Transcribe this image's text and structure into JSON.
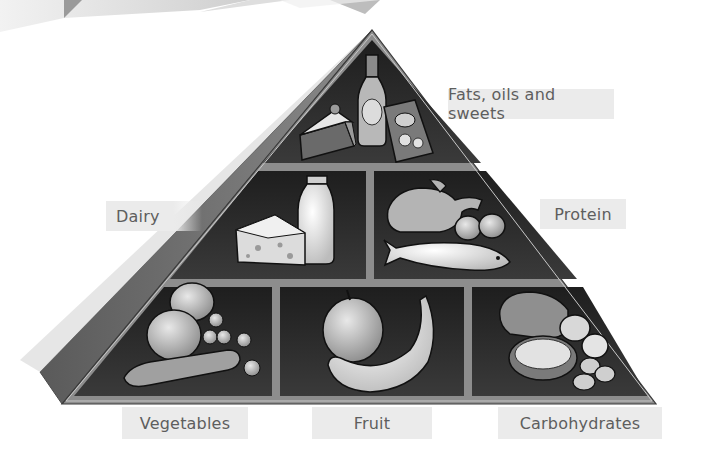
{
  "diagram": {
    "type": "food-pyramid",
    "tiers": [
      {
        "level": "top",
        "groups": [
          {
            "id": "fats",
            "label": "Fats, oils and sweets",
            "items": [
              "cake slice",
              "bottle",
              "crisps bag"
            ]
          }
        ]
      },
      {
        "level": "middle",
        "groups": [
          {
            "id": "dairy",
            "label": "Dairy",
            "items": [
              "cheese wedge",
              "milk bottle"
            ]
          },
          {
            "id": "protein",
            "label": "Protein",
            "items": [
              "chicken",
              "fish",
              "eggs"
            ]
          }
        ]
      },
      {
        "level": "bottom",
        "groups": [
          {
            "id": "vegetables",
            "label": "Vegetables",
            "items": [
              "onion",
              "carrot",
              "peas"
            ]
          },
          {
            "id": "fruit",
            "label": "Fruit",
            "items": [
              "apple",
              "banana"
            ]
          },
          {
            "id": "carbs",
            "label": "Carbohydrates",
            "items": [
              "bread",
              "rice bowl",
              "potatoes"
            ]
          }
        ]
      }
    ]
  },
  "labels": {
    "fats": "Fats, oils and sweets",
    "dairy": "Dairy",
    "protein": "Protein",
    "vegetables": "Vegetables",
    "fruit": "Fruit",
    "carbs": "Carbohydrates"
  },
  "colors": {
    "panel_dark": "#2b2b2b",
    "frame": "#8a8a8a",
    "side_face": "#6f6f6f",
    "label_bg": "#ebebeb",
    "label_text": "#5e5e5e"
  }
}
